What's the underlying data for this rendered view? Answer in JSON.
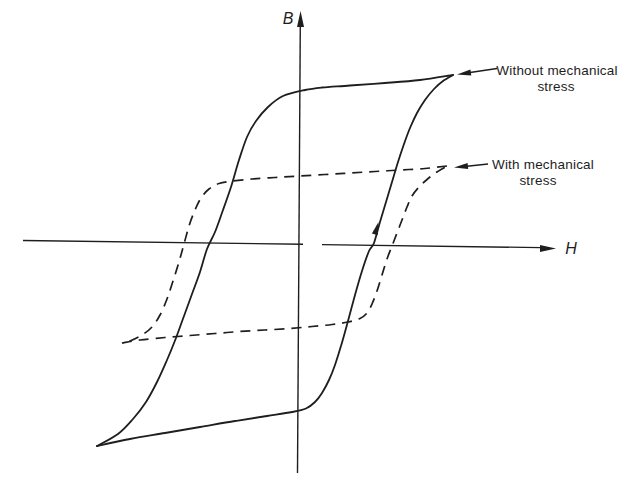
{
  "colors": {
    "background": "#ffffff",
    "ink": "#1e1e1e"
  },
  "axes": {
    "b_label": "B",
    "h_label": "H",
    "b_axis_line": [
      300.3,
      24,
      297.5,
      473
    ],
    "b_axis_arrow": "300.5,11 297,27 304,27",
    "h_axis_segments": [
      [
        23,
        240.5,
        303,
        244.3
      ],
      [
        322,
        244.6,
        541,
        247.6
      ]
    ],
    "h_axis_arrow": "556,248.5 540,245 540,252"
  },
  "curves": {
    "solid_loop": {
      "label": "Without mechanical stress",
      "style": "solid",
      "branch_upper_left": [
        [
          453,
          75
        ],
        [
          420,
          80
        ],
        [
          385,
          83
        ],
        [
          350,
          85.5
        ],
        [
          322,
          87.5
        ],
        [
          305,
          90
        ],
        [
          283,
          96
        ],
        [
          268,
          107
        ],
        [
          256,
          121
        ],
        [
          247,
          137
        ],
        [
          239,
          160
        ],
        [
          231,
          187
        ],
        [
          223,
          210
        ],
        [
          215,
          232
        ],
        [
          207,
          249
        ],
        [
          200,
          272
        ],
        [
          192,
          294
        ],
        [
          184,
          316
        ],
        [
          176,
          338
        ],
        [
          167,
          360
        ],
        [
          157,
          382
        ],
        [
          146,
          402
        ],
        [
          133,
          419
        ],
        [
          118,
          434
        ],
        [
          97,
          446
        ]
      ],
      "branch_lower_right": [
        [
          97,
          446
        ],
        [
          130,
          439
        ],
        [
          165,
          433
        ],
        [
          200,
          427
        ],
        [
          235,
          421
        ],
        [
          267,
          416
        ],
        [
          292,
          412
        ],
        [
          306,
          408.5
        ],
        [
          315,
          402
        ],
        [
          322,
          393
        ],
        [
          329,
          380
        ],
        [
          335,
          365
        ],
        [
          341,
          346
        ],
        [
          348,
          321
        ],
        [
          355,
          295
        ],
        [
          362,
          271
        ],
        [
          369,
          251
        ],
        [
          374,
          243
        ],
        [
          380,
          222
        ],
        [
          386,
          202
        ],
        [
          392,
          182
        ],
        [
          398,
          162
        ],
        [
          404,
          144
        ],
        [
          410,
          128
        ],
        [
          417,
          113
        ],
        [
          425,
          100
        ],
        [
          434,
          89
        ],
        [
          443,
          81
        ],
        [
          453,
          75
        ]
      ]
    },
    "dashed_loop": {
      "label": "With mechanical stress",
      "style": "dashed",
      "dash_pattern": "10 7",
      "branch_upper_left": [
        [
          447,
          166
        ],
        [
          425,
          168.5
        ],
        [
          400,
          170
        ],
        [
          375,
          171.5
        ],
        [
          350,
          173
        ],
        [
          325,
          174.5
        ],
        [
          299,
          176
        ],
        [
          275,
          177.5
        ],
        [
          252,
          179
        ],
        [
          233,
          181
        ],
        [
          219,
          183.5
        ],
        [
          209,
          189
        ],
        [
          201,
          198
        ],
        [
          195,
          210
        ],
        [
          189,
          226
        ],
        [
          184,
          244
        ],
        [
          179,
          262
        ],
        [
          173,
          281
        ],
        [
          167,
          299
        ],
        [
          160,
          315
        ],
        [
          152,
          327
        ],
        [
          142,
          335
        ],
        [
          130,
          341
        ],
        [
          122,
          343
        ]
      ],
      "branch_lower_right": [
        [
          122,
          343
        ],
        [
          140,
          340
        ],
        [
          165,
          337.5
        ],
        [
          190,
          335.5
        ],
        [
          215,
          333.5
        ],
        [
          240,
          331.5
        ],
        [
          265,
          330
        ],
        [
          290,
          328.5
        ],
        [
          312,
          326.5
        ],
        [
          332,
          324.5
        ],
        [
          348,
          322
        ],
        [
          360,
          318.5
        ],
        [
          367,
          313
        ],
        [
          372,
          304
        ],
        [
          377,
          291
        ],
        [
          382,
          275
        ],
        [
          387,
          259
        ],
        [
          392,
          246
        ],
        [
          397,
          233
        ],
        [
          402,
          220
        ],
        [
          407,
          207
        ],
        [
          412,
          196
        ],
        [
          419,
          187
        ],
        [
          427,
          179.5
        ],
        [
          436,
          172.5
        ],
        [
          447,
          166
        ]
      ]
    },
    "direction_arrow": "378.5,222 377.7,235.3 371.9,233.6"
  },
  "annotations": {
    "without_stress": {
      "line1": "Without mechanical",
      "line2": "stress",
      "tail": [
        497,
        68.5,
        470,
        72.5
      ],
      "head": "457,74.5 470.4,69.4 471.3,75.4"
    },
    "with_stress": {
      "line1": "With mechanical",
      "line2": "stress",
      "tail": [
        488,
        164,
        467,
        166.3
      ],
      "head": "454,167.5 467.6,163.1 468.2,169.1"
    }
  }
}
